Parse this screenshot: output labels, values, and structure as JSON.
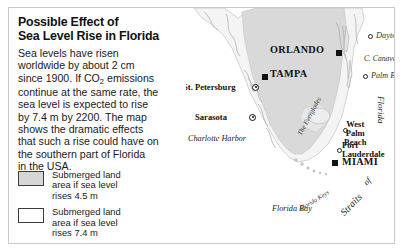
{
  "figure": {
    "title": "Possible Effect of\nSea Level Rise in Florida",
    "body_part1": "Sea levels have risen\nworldwide by about 2 cm\nsince 1900. If CO",
    "body_sub": "2",
    "body_part2": " emissions\ncontinue at the same rate, the\nsea level is expected to rise\nby 7.4 m by 2200. The map\nshows the dramatic effects\nthat such a rise could have on\nthe southern part of Florida\nin the USA."
  },
  "legend": {
    "items": [
      {
        "label": "Submerged land\narea if sea level\nrises 4.5 m",
        "color": "#d6d6d6"
      },
      {
        "label": "Submerged land\narea if sea level\nrises 7.4 m",
        "color": "#ffffff"
      }
    ]
  },
  "map": {
    "cities": [
      {
        "name": "ORLANDO",
        "marker": "square"
      },
      {
        "name": "TAMPA",
        "marker": "square"
      },
      {
        "name": "MIAMI",
        "marker": "square"
      },
      {
        "name": "St. Petersburg",
        "marker": "ring"
      },
      {
        "name": "Sarasota",
        "marker": "ring"
      },
      {
        "name": "Daytona Beach",
        "marker": "open-circle"
      },
      {
        "name": "Palm Bay",
        "marker": "open-circle"
      },
      {
        "name": "Fort\nLauderdale",
        "marker": "open-circle"
      },
      {
        "name": "West\nPalm\nBeach",
        "marker": "open-circle"
      }
    ],
    "features": [
      {
        "name": "C. Canaveral"
      },
      {
        "name": "Charlotte Harbor"
      },
      {
        "name": "Florida Bay"
      },
      {
        "name": "Florida Keys"
      },
      {
        "name": "The Everglades"
      },
      {
        "name": "Straits"
      },
      {
        "name": "of"
      },
      {
        "name": "Florida"
      }
    ],
    "colors": {
      "land": "#f2f2f2",
      "submerged_4_5": "#d6d6d6",
      "coastline": "#9a9a9a"
    }
  }
}
